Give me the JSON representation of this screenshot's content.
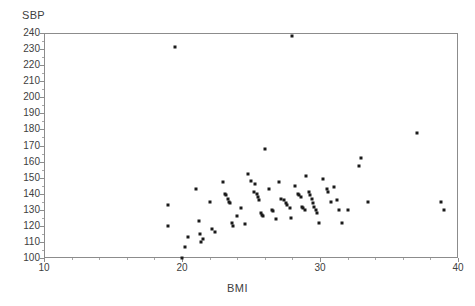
{
  "chart_data": {
    "type": "scatter",
    "title": "",
    "ylabel": "SBP",
    "xlabel": "BMI",
    "xlim": [
      10,
      40
    ],
    "ylim": [
      100,
      240
    ],
    "x_ticks": [
      10,
      20,
      30,
      40
    ],
    "x_tick_labels": [
      "10",
      "20",
      "30",
      "40"
    ],
    "x_minor_tick_step": 2,
    "y_ticks": [
      100,
      110,
      120,
      130,
      140,
      150,
      160,
      170,
      180,
      190,
      200,
      210,
      220,
      230,
      240
    ],
    "y_tick_labels": [
      "100",
      "110",
      "120",
      "130",
      "140",
      "150",
      "160",
      "170",
      "180",
      "190",
      "200",
      "210",
      "220",
      "230",
      "240"
    ],
    "y_minor_tick_step": 5,
    "grid": false,
    "legend": false,
    "marker": "square",
    "marker_color": "#1a1a1a",
    "marker_size_px": 3,
    "n_points": 78,
    "points": [
      [
        19.0,
        133
      ],
      [
        19.0,
        120
      ],
      [
        19.5,
        231
      ],
      [
        20.0,
        100
      ],
      [
        20.2,
        107
      ],
      [
        20.4,
        113
      ],
      [
        21.0,
        143
      ],
      [
        21.2,
        123
      ],
      [
        21.3,
        115
      ],
      [
        21.4,
        110
      ],
      [
        21.5,
        112
      ],
      [
        22.0,
        135
      ],
      [
        22.2,
        118
      ],
      [
        22.4,
        116
      ],
      [
        23.0,
        147
      ],
      [
        23.1,
        140
      ],
      [
        23.2,
        139
      ],
      [
        23.3,
        137
      ],
      [
        23.4,
        135
      ],
      [
        23.5,
        134
      ],
      [
        23.6,
        122
      ],
      [
        23.7,
        120
      ],
      [
        24.0,
        126
      ],
      [
        24.3,
        131
      ],
      [
        24.6,
        121
      ],
      [
        25.0,
        148
      ],
      [
        25.2,
        141
      ],
      [
        25.4,
        140
      ],
      [
        25.5,
        138
      ],
      [
        25.6,
        136
      ],
      [
        25.7,
        128
      ],
      [
        25.8,
        127
      ],
      [
        25.9,
        126
      ],
      [
        26.0,
        168
      ],
      [
        26.3,
        143
      ],
      [
        26.5,
        130
      ],
      [
        26.6,
        129
      ],
      [
        26.8,
        124
      ],
      [
        27.0,
        147
      ],
      [
        27.2,
        137
      ],
      [
        27.4,
        136
      ],
      [
        27.5,
        134
      ],
      [
        27.6,
        133
      ],
      [
        27.8,
        131
      ],
      [
        27.9,
        125
      ],
      [
        28.0,
        238
      ],
      [
        28.2,
        145
      ],
      [
        28.4,
        140
      ],
      [
        28.5,
        139
      ],
      [
        28.6,
        138
      ],
      [
        28.7,
        132
      ],
      [
        28.8,
        131
      ],
      [
        28.9,
        130
      ],
      [
        29.0,
        151
      ],
      [
        29.2,
        141
      ],
      [
        29.3,
        139
      ],
      [
        29.4,
        137
      ],
      [
        29.5,
        134
      ],
      [
        29.6,
        132
      ],
      [
        29.7,
        130
      ],
      [
        29.8,
        128
      ],
      [
        29.9,
        122
      ],
      [
        30.2,
        149
      ],
      [
        30.5,
        143
      ],
      [
        30.6,
        141
      ],
      [
        30.8,
        135
      ],
      [
        31.0,
        144
      ],
      [
        31.2,
        136
      ],
      [
        31.4,
        130
      ],
      [
        31.6,
        122
      ],
      [
        32.0,
        130
      ],
      [
        32.8,
        157
      ],
      [
        33.0,
        162
      ],
      [
        33.5,
        135
      ],
      [
        37.0,
        178
      ],
      [
        38.8,
        135
      ],
      [
        39.0,
        130
      ],
      [
        25.3,
        146
      ],
      [
        24.8,
        152
      ]
    ]
  }
}
